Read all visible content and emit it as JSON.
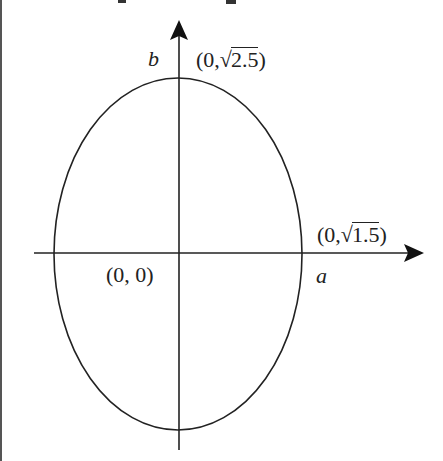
{
  "diagram": {
    "type": "ellipse-on-axes",
    "axes": {
      "horizontal_label": "a",
      "vertical_label": "b"
    },
    "points": {
      "origin": "(0, 0)",
      "top": {
        "prefix": "(0,",
        "radical": "√",
        "radicand": "2.5",
        "suffix": ")"
      },
      "right": {
        "prefix": "(0,",
        "radical": "√",
        "radicand": "1.5",
        "suffix": ")"
      }
    },
    "semi_axis_horizontal": "√1.5",
    "semi_axis_vertical": "√2.5",
    "colors": {
      "stroke": "#222222",
      "background": "#ffffff"
    }
  }
}
